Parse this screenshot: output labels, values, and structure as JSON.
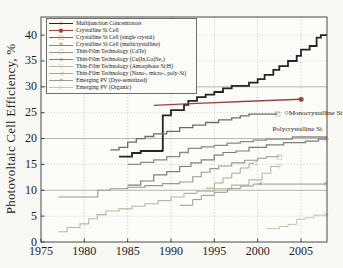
{
  "figure": {
    "title": "",
    "background": "#f8f8f4",
    "axis_color": "#4a4a45",
    "text_color": "#1d1d1d"
  },
  "chart_data": {
    "type": "line",
    "title": "",
    "xlabel": "",
    "ylabel": "Photovoltaic Cell Efficiency, %",
    "xlim": [
      1975,
      2008
    ],
    "ylim": [
      0,
      43.5
    ],
    "xticks": [
      1975,
      1980,
      1985,
      1990,
      1995,
      2000,
      2005
    ],
    "yticks": [
      0,
      5,
      10,
      15,
      20,
      25,
      30,
      35,
      40
    ],
    "grid": {
      "vertical": "dotted at every x tick",
      "horizontal_solid": [
        10,
        20,
        30
      ],
      "horizontal_dotted": [
        5,
        15,
        25,
        35,
        40
      ],
      "grid_color": "#aaaaa4"
    },
    "legend_position": "upper-left",
    "series": [
      {
        "id": "multijunction",
        "label": "Multijunction Concentrators",
        "marker_name": "plus-marker",
        "glyph": "+",
        "color": "#252525",
        "width": 1.8,
        "step": true,
        "points": [
          [
            1984,
            16.5
          ],
          [
            1985.5,
            17.2
          ],
          [
            1986.5,
            17.6
          ],
          [
            1989,
            17.7
          ],
          [
            1989.05,
            24.5
          ],
          [
            1990,
            25.5
          ],
          [
            1991.5,
            26.5
          ],
          [
            1992,
            27.3
          ],
          [
            1993,
            28.0
          ],
          [
            1994,
            28.5
          ],
          [
            1995,
            29.0
          ],
          [
            1996,
            29.7
          ],
          [
            1997,
            30.2
          ],
          [
            1999,
            30.8
          ],
          [
            2000,
            31.5
          ],
          [
            2000.8,
            32.3
          ],
          [
            2001.8,
            33.3
          ],
          [
            2002.5,
            34.0
          ],
          [
            2003.5,
            35.0
          ],
          [
            2004.5,
            36.0
          ],
          [
            2005,
            37.2
          ],
          [
            2006,
            37.9
          ],
          [
            2006.8,
            39.5
          ],
          [
            2007.3,
            40.0
          ],
          [
            2008,
            40.0
          ]
        ],
        "markers": []
      },
      {
        "id": "crystalline-si",
        "label": "Crystalline Si Cell",
        "marker_name": "filled-circle-marker",
        "glyph": "●",
        "color": "#94463e",
        "width": 1.4,
        "step": false,
        "points": [
          [
            1988,
            26.4
          ],
          [
            1993,
            26.8
          ],
          [
            1999,
            27.2
          ],
          [
            2005,
            27.6
          ]
        ],
        "markers": [
          [
            2005,
            27.6
          ]
        ]
      },
      {
        "id": "mono-si",
        "label": "Crystalline Si Cell (single crystal)",
        "marker_name": "open-square-marker",
        "glyph": "□",
        "color": "#6d6d68",
        "width": 1.3,
        "step": true,
        "points": [
          [
            1983,
            17.8
          ],
          [
            1984,
            18.3
          ],
          [
            1985,
            19.3
          ],
          [
            1986,
            20.0
          ],
          [
            1987,
            20.4
          ],
          [
            1988,
            20.9
          ],
          [
            1989.5,
            21.4
          ],
          [
            1991,
            22.1
          ],
          [
            1992.5,
            22.6
          ],
          [
            1994,
            23.1
          ],
          [
            1995.5,
            23.6
          ],
          [
            1997,
            24.0
          ],
          [
            1998,
            24.4
          ],
          [
            1999,
            24.7
          ],
          [
            2002.3,
            24.7
          ]
        ],
        "markers": [
          [
            2002.3,
            24.7
          ]
        ]
      },
      {
        "id": "poly-si",
        "label": "Crystalline Si Cell (multicrystalline)",
        "marker_name": "asterisk-marker",
        "glyph": "✳",
        "color": "#8a8a84",
        "width": 1.3,
        "step": true,
        "points": [
          [
            1985,
            15.0
          ],
          [
            1986.5,
            15.4
          ],
          [
            1988,
            15.9
          ],
          [
            1989.5,
            16.5
          ],
          [
            1991,
            17.3
          ],
          [
            1992,
            18.1
          ],
          [
            1993.5,
            18.4
          ],
          [
            1995,
            18.7
          ],
          [
            1996.5,
            19.1
          ],
          [
            1998,
            19.4
          ],
          [
            1999.5,
            19.7
          ],
          [
            2001,
            19.9
          ],
          [
            2004,
            20.3
          ],
          [
            2008,
            20.3
          ]
        ],
        "markers": []
      },
      {
        "id": "cdte",
        "label": "Thin-Film Technology (CdTe)",
        "marker_name": "open-square-marker",
        "glyph": "□",
        "color": "#98988f",
        "width": 1.1,
        "step": true,
        "points": [
          [
            1977,
            8.7
          ],
          [
            1981.5,
            8.7
          ],
          [
            1981.55,
            10.0
          ],
          [
            1983,
            10.3
          ],
          [
            1985,
            10.6
          ],
          [
            1987,
            10.9
          ],
          [
            1989,
            11.3
          ],
          [
            1991,
            11.6
          ],
          [
            1992.5,
            12.6
          ],
          [
            1993.5,
            13.5
          ],
          [
            1994.5,
            14.2
          ],
          [
            1995.5,
            14.7
          ],
          [
            1997,
            15.3
          ],
          [
            1998.5,
            15.8
          ],
          [
            2000,
            16.2
          ],
          [
            2001,
            16.5
          ],
          [
            2002.5,
            16.5
          ]
        ],
        "markers": [
          [
            2002.5,
            16.5
          ]
        ]
      },
      {
        "id": "cigs",
        "label": "Thin-Film Technology (Cu(In,Ga)Se₂)",
        "marker_name": "open-diamond-marker",
        "glyph": "◇",
        "color": "#7f7f78",
        "width": 1.2,
        "step": true,
        "points": [
          [
            1985,
            11.0
          ],
          [
            1986.5,
            11.8
          ],
          [
            1988,
            13.0
          ],
          [
            1989.5,
            13.6
          ],
          [
            1991,
            14.6
          ],
          [
            1992.3,
            15.3
          ],
          [
            1993.5,
            15.9
          ],
          [
            1995,
            16.8
          ],
          [
            1996,
            17.3
          ],
          [
            1997.5,
            17.6
          ],
          [
            1999,
            18.3
          ],
          [
            2001,
            18.8
          ],
          [
            2003,
            19.2
          ],
          [
            2005.5,
            19.5
          ],
          [
            2007,
            19.9
          ],
          [
            2008,
            19.9
          ]
        ],
        "markers": [
          [
            2007.9,
            19.9
          ]
        ]
      },
      {
        "id": "a-si",
        "label": "Thin-Film Technology (Amorphous Si:H)",
        "marker_name": "down-triangle-marker",
        "glyph": "▽",
        "color": "#b5b5a8",
        "width": 1.1,
        "step": true,
        "points": [
          [
            1977,
            2.0
          ],
          [
            1978,
            2.8
          ],
          [
            1979.5,
            3.5
          ],
          [
            1980.5,
            4.5
          ],
          [
            1981.5,
            5.3
          ],
          [
            1982.5,
            6.0
          ],
          [
            1984,
            6.4
          ],
          [
            1985.5,
            6.9
          ],
          [
            1987,
            7.4
          ],
          [
            1988.5,
            8.0
          ],
          [
            1990,
            8.7
          ],
          [
            1991.5,
            9.4
          ],
          [
            1993,
            9.8
          ],
          [
            1995,
            10.3
          ],
          [
            1997,
            11.0
          ],
          [
            1999,
            12.0
          ],
          [
            2000.5,
            13.3
          ],
          [
            2001.5,
            14.6
          ],
          [
            2002.5,
            14.6
          ]
        ],
        "markers": [
          [
            2002.5,
            14.6
          ]
        ]
      },
      {
        "id": "nano-si",
        "label": "Thin-Film Technology (Nano-, micro-, poly-Si)",
        "marker_name": "left-triangle-marker",
        "glyph": "◁",
        "color": "#a9a9a0",
        "width": 1.0,
        "step": true,
        "points": [
          [
            1994,
            10.4
          ],
          [
            1995,
            11.4
          ],
          [
            1996,
            12.4
          ],
          [
            1997,
            13.3
          ],
          [
            1998,
            14.3
          ],
          [
            1999,
            15.2
          ],
          [
            1999.6,
            15.2
          ]
        ],
        "markers": [
          [
            1999.6,
            15.2
          ]
        ]
      },
      {
        "id": "dye",
        "label": "Emerging PV (Dye-sensitized)",
        "marker_name": "star-marker",
        "glyph": "✳",
        "color": "#9a9a90",
        "width": 1.0,
        "step": true,
        "points": [
          [
            1991,
            7.1
          ],
          [
            1992.5,
            8.2
          ],
          [
            1993.5,
            9.0
          ],
          [
            1995,
            9.6
          ],
          [
            1996.5,
            10.3
          ],
          [
            1998,
            10.8
          ],
          [
            1999.5,
            11.2
          ],
          [
            2008,
            11.2
          ]
        ],
        "markers": [
          [
            2000.3,
            11.2
          ],
          [
            2007.8,
            11.2
          ]
        ]
      },
      {
        "id": "organic",
        "label": "Emerging PV (Organic)",
        "marker_name": "right-triangle-marker",
        "glyph": "▷",
        "color": "#c2c2b4",
        "width": 1.0,
        "step": true,
        "points": [
          [
            2001,
            2.6
          ],
          [
            2002.5,
            3.0
          ],
          [
            2003.5,
            3.4
          ],
          [
            2004.5,
            4.4
          ],
          [
            2005.5,
            4.7
          ],
          [
            2006.5,
            5.2
          ],
          [
            2008,
            5.4
          ]
        ],
        "markers": [
          [
            2007.9,
            5.4
          ]
        ]
      }
    ],
    "annotations": [
      {
        "text": "Monocrystalline Si",
        "year": 2003.1,
        "value": 24.9,
        "prefix_marker": true
      },
      {
        "text": "Polycrystalline Si",
        "year": 2001.7,
        "value": 21.8,
        "prefix_marker": false
      }
    ]
  }
}
